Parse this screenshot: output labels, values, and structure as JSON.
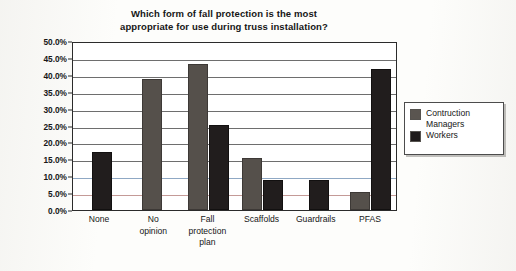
{
  "chart_data": {
    "type": "bar",
    "title": "Which form of fall protection is the most appropriate for use during truss installation?",
    "title_line1": "Which form of fall protection is the most",
    "title_line2": "appropriate for use during truss installation?",
    "xlabel": "",
    "ylabel": "Frequency",
    "ylim": [
      0,
      50
    ],
    "ytick_step": 5,
    "grid": true,
    "legend_position": "right",
    "categories": [
      "None",
      "No opinion",
      "Fall protection plan",
      "Scaffolds",
      "Guardrails",
      "PFAS"
    ],
    "category_labels": [
      "None",
      "No\nopinion",
      "Fall\nprotection\nplan",
      "Scaffolds",
      "Guardrails",
      "PFAS"
    ],
    "ytick_labels": [
      "50.0%",
      "45.0%",
      "40.0%",
      "35.0%",
      "30.0%",
      "25.0%",
      "20.0%",
      "15.0%",
      "10.0%",
      "5.0%",
      "0.0%"
    ],
    "ytick_values": [
      50,
      45,
      40,
      35,
      30,
      25,
      20,
      15,
      10,
      5,
      0
    ],
    "series": [
      {
        "name": "Contruction Managers",
        "name_line1": "Contruction",
        "name_line2": "Managers",
        "color": "#55504b",
        "values": [
          0,
          38.8,
          43.3,
          15.3,
          0,
          5.3
        ]
      },
      {
        "name": "Workers",
        "name_line1": "Workers",
        "name_line2": "",
        "color": "#211d1d",
        "values": [
          17.2,
          0,
          25.2,
          8.8,
          8.8,
          41.8
        ]
      }
    ]
  }
}
